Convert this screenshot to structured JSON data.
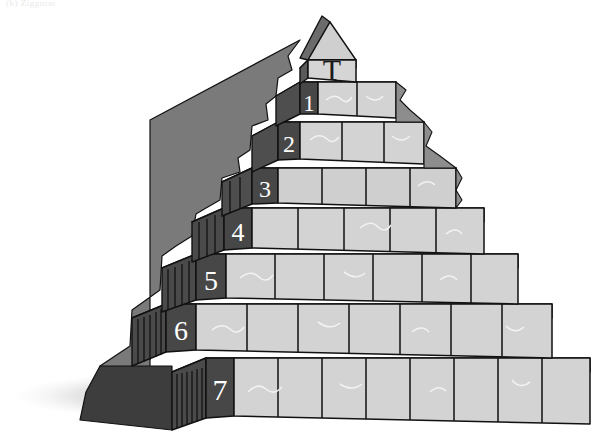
{
  "figure": {
    "title_fragment": "(b)  Ziggurat",
    "capstone_label": "T",
    "background_color": "#ffffff"
  },
  "palette": {
    "face_light": "#d2d2d2",
    "face_light_alt": "#c9c9c9",
    "face_top": "#f4f4f4",
    "face_dark": "#4e4e4e",
    "face_dark_alt": "#3f3f3f",
    "face_right": "#b8b8b8",
    "outline": "#111111",
    "rubble": "#6e6e6e",
    "rubble_dark": "#3a3a3a",
    "shadow": "#c8c8c8",
    "number_color": "#ffffff",
    "capstone_letter_color": "#1a1a1a"
  },
  "tiers": [
    {
      "id": "tier-1",
      "label": "1",
      "y_top": 82,
      "y_bottom": 122,
      "left": 276,
      "right": 396,
      "light_blocks": 2,
      "dark_blocks": 1
    },
    {
      "id": "tier-2",
      "label": "2",
      "y_top": 122,
      "y_bottom": 168,
      "left": 252,
      "right": 424,
      "light_blocks": 3,
      "dark_blocks": 1
    },
    {
      "id": "tier-3",
      "label": "3",
      "y_top": 168,
      "y_bottom": 208,
      "left": 222,
      "right": 456,
      "light_blocks": 4,
      "dark_blocks": 3
    },
    {
      "id": "tier-4",
      "label": "4",
      "y_top": 208,
      "y_bottom": 254,
      "left": 192,
      "right": 484,
      "light_blocks": 5,
      "dark_blocks": 4
    },
    {
      "id": "tier-5",
      "label": "5",
      "y_top": 254,
      "y_bottom": 305,
      "left": 162,
      "right": 518,
      "light_blocks": 6,
      "dark_blocks": 5
    },
    {
      "id": "tier-6",
      "label": "6",
      "y_top": 305,
      "y_bottom": 360,
      "left": 132,
      "right": 552,
      "light_blocks": 7,
      "dark_blocks": 6
    },
    {
      "id": "tier-7",
      "label": "7",
      "y_top": 360,
      "y_bottom": 430,
      "left": 100,
      "right": 590,
      "light_blocks": 8,
      "dark_blocks": 7
    }
  ],
  "capstone": {
    "id": "capstone",
    "label": "T",
    "y_top": 46,
    "y_bottom": 82,
    "left": 300,
    "right": 352,
    "roof_apex_x": 326,
    "roof_apex_y": 16
  },
  "ground_shadow": {
    "name": "ground-shadow",
    "x": 20,
    "y": 372,
    "width": 300,
    "height": 46
  }
}
